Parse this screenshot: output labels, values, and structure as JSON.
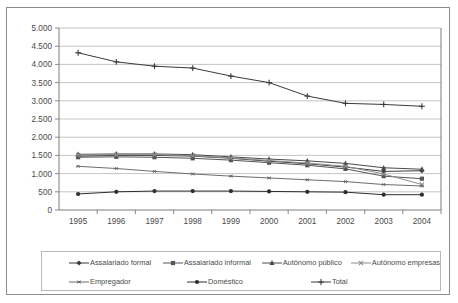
{
  "chart_data": {
    "type": "line",
    "title": "",
    "xlabel": "",
    "ylabel": "",
    "x": [
      "1995",
      "1996",
      "1997",
      "1998",
      "1999",
      "2000",
      "2001",
      "2002",
      "2003",
      "2004"
    ],
    "categories": [
      "1995",
      "1996",
      "1997",
      "1998",
      "1999",
      "2000",
      "2001",
      "2002",
      "2003",
      "2004"
    ],
    "ylim": [
      0,
      5000
    ],
    "ytick_labels": [
      "5.000",
      "4.500",
      "4.000",
      "3.500",
      "3.000",
      "2.500",
      "2.000",
      "1.500",
      "1.000",
      "500",
      "0"
    ],
    "ytick_values": [
      5000,
      4500,
      4000,
      3500,
      3000,
      2500,
      2000,
      1500,
      1000,
      500,
      0
    ],
    "ytick_step": 500,
    "grid": true,
    "legend_position": "bottom",
    "series": [
      {
        "name": "Assalariado formal",
        "marker": "diamond",
        "color": "#3a3a3a",
        "values": [
          1480,
          1500,
          1500,
          1480,
          1420,
          1340,
          1270,
          1180,
          1060,
          1080
        ]
      },
      {
        "name": "Assalariado informal",
        "marker": "square",
        "color": "#555555",
        "values": [
          1450,
          1460,
          1450,
          1420,
          1370,
          1300,
          1230,
          1130,
          930,
          860
        ]
      },
      {
        "name": "Autônomo público",
        "marker": "triangle",
        "color": "#4a4a4a",
        "values": [
          1530,
          1540,
          1540,
          1520,
          1460,
          1400,
          1350,
          1280,
          1160,
          1120
        ]
      },
      {
        "name": "Autônomo empresas",
        "marker": "cross",
        "color": "#8e8e8e",
        "values": [
          1510,
          1520,
          1520,
          1490,
          1430,
          1360,
          1290,
          1200,
          990,
          700
        ]
      },
      {
        "name": "Empregador",
        "marker": "asterisk",
        "color": "#6d6d6d",
        "values": [
          1200,
          1140,
          1060,
          990,
          930,
          880,
          830,
          780,
          700,
          660
        ]
      },
      {
        "name": "Doméstico",
        "marker": "circle",
        "color": "#2e2e2e",
        "values": [
          440,
          500,
          520,
          520,
          520,
          510,
          500,
          490,
          420,
          420
        ]
      },
      {
        "name": "Total",
        "marker": "plus",
        "color": "#3a3a3a",
        "values": [
          4320,
          4070,
          3950,
          3900,
          3680,
          3500,
          3130,
          2930,
          2900,
          2850
        ]
      }
    ]
  }
}
